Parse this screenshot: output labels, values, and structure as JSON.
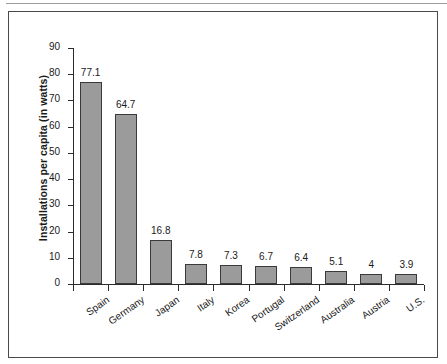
{
  "chart_data": {
    "type": "bar",
    "title": "",
    "subtitle": "",
    "xlabel": "",
    "ylabel": "Installations per capita (in watts)",
    "categories": [
      "Spain",
      "Germany",
      "Japan",
      "Italy",
      "Korea",
      "Portugal",
      "Switzerland",
      "Australia",
      "Austria",
      "U.S."
    ],
    "values": [
      77.1,
      64.7,
      16.8,
      7.8,
      7.3,
      6.7,
      6.4,
      5.1,
      4,
      3.9
    ],
    "value_labels": [
      "77.1",
      "64.7",
      "16.8",
      "7.8",
      "7.3",
      "6.7",
      "6.4",
      "5.1",
      "4",
      "3.9"
    ],
    "ylim": [
      0,
      90
    ],
    "ytick_values": [
      0,
      10,
      20,
      30,
      40,
      50,
      60,
      70,
      80,
      90
    ],
    "ytick_labels": [
      "0",
      "10",
      "20",
      "30",
      "40",
      "50",
      "60",
      "70",
      "80",
      "90"
    ],
    "grid": false,
    "legend": null,
    "legend_position": "none",
    "bar_color": "#9b9b9b",
    "bar_border_color": "#3a3a3a",
    "axis_color": "#2b2b2b",
    "frame_color": "#4a4a4a",
    "text_color": "#1a1a1a",
    "background": "#ffffff"
  }
}
